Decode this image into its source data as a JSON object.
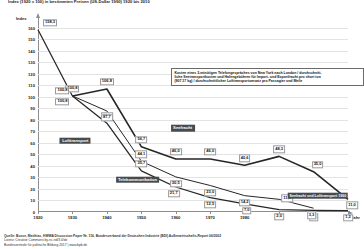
{
  "title": "Index (1920 = 100) in bestimmten Preisen (US-Dollar 1990) 1920 bis 2010",
  "axis": {
    "y_unit": "Index",
    "x_label": "Jahr"
  },
  "annotation": {
    "line1": "Kosten eines 3-minütigen Telefongespräches von New York nach London / durchschnitt-",
    "line2": "liche Seetransportkosten und Hafengebühren für Import- und Exportfracht pro short ton",
    "line3": "(907,17 kg) / durchschnittlicher Lufttransportumsatz pro Passagier und Meile"
  },
  "series_labels": {
    "air": "Lufttransport",
    "sea": "Seefracht",
    "telecom": "Telekommunikation",
    "combined": "Seefracht und Lufttransport 1960"
  },
  "footer": {
    "source": "Quelle: Busse, Matthias, HWWA Discussion Paper Nr. 116, Bundesverband der Deutschen Industrie (BDI) Außenwirtschafts-Report 06/2002",
    "license": "Lizenz: Creative Commons by-nc-nd/3.0/de",
    "publisher": "Bundeszentrale für politische Bildung 2017  |  www.bpb.de"
  },
  "chart_data": {
    "type": "line",
    "title": "Index (1920 = 100) in bestimmten Preisen (US-Dollar 1990) 1920 bis 2010",
    "xlabel": "Jahr",
    "ylabel": "Index",
    "xlim": [
      1920,
      2010
    ],
    "ylim": [
      0,
      165
    ],
    "grid": true,
    "legend": "inline-labels",
    "yticks": [
      0,
      10,
      20,
      30,
      40,
      50,
      60,
      70,
      80,
      90,
      100,
      110,
      120,
      130,
      140,
      150,
      160
    ],
    "xticks": [
      1920,
      1930,
      1940,
      1950,
      1960,
      1970,
      1980,
      1990,
      2000,
      2010
    ],
    "series": [
      {
        "name": "Telekommunikation",
        "x": [
          1920,
          1930,
          1940,
          1950,
          1960,
          1970,
          1980,
          1990,
          2000,
          2010
        ],
        "values": [
          158.3,
          100.8,
          77.1,
          35.7,
          21.7,
          12.5,
          7.0,
          2.0,
          1.4,
          1.2
        ],
        "labels": [
          "158,3",
          "100,8",
          "77,1",
          "35,7",
          "21,7",
          "12,5",
          "7,0",
          "2,0",
          "1,4",
          "1,2"
        ]
      },
      {
        "name": "Seefracht",
        "x": [
          1930,
          1940,
          1950,
          1960,
          1970,
          1980,
          1990,
          2000,
          2010
        ],
        "values": [
          100.8,
          106.8,
          56.7,
          46.0,
          46.0,
          40.6,
          48.3,
          35.0,
          11.0
        ],
        "labels": [
          "100,8",
          "106,8",
          "56,7",
          "46,0",
          "46,0",
          "40,6",
          "48,3",
          "35,0",
          "11,0"
        ]
      },
      {
        "name": "Lufttransport",
        "x": [
          1930,
          1940,
          1950,
          1960,
          1970,
          1980,
          1990,
          2000
        ],
        "values": [
          100.8,
          87.7,
          44.1,
          30.5,
          23.0,
          14.2,
          11.0,
          3.3
        ],
        "labels": [
          "100,8",
          "87,7",
          "44,1",
          "30,5",
          "23,0",
          "14,2",
          "11,0",
          "3,3"
        ]
      }
    ]
  }
}
